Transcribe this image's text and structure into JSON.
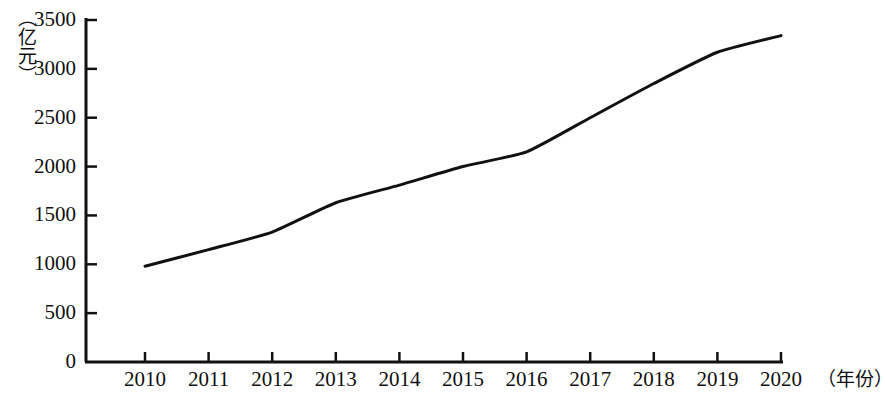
{
  "chart_data": {
    "type": "line",
    "title": "",
    "subtitle": "",
    "xlabel": "（年份）",
    "ylabel": "（亿元）",
    "x": [
      2010,
      2011,
      2012,
      2013,
      2014,
      2015,
      2016,
      2017,
      2018,
      2019,
      2020
    ],
    "categories": [
      "2010",
      "2011",
      "2012",
      "2013",
      "2014",
      "2015",
      "2016",
      "2017",
      "2018",
      "2019",
      "2020"
    ],
    "values": [
      980,
      1150,
      1330,
      1630,
      1810,
      2000,
      2150,
      2500,
      2850,
      3170,
      3340
    ],
    "series": [
      {
        "name": "",
        "values": [
          980,
          1150,
          1330,
          1630,
          1810,
          2000,
          2150,
          2500,
          2850,
          3170,
          3340
        ]
      }
    ],
    "xlim": [
      2010,
      2020
    ],
    "ylim": [
      0,
      3500
    ],
    "ytick_labels": [
      "0",
      "500",
      "1000",
      "1500",
      "2000",
      "2500",
      "3000",
      "3500"
    ],
    "ytick_values": [
      0,
      500,
      1000,
      1500,
      2000,
      2500,
      3000,
      3500
    ],
    "xtick_labels": [
      "2010",
      "2011",
      "2012",
      "2013",
      "2014",
      "2015",
      "2016",
      "2017",
      "2018",
      "2019",
      "2020"
    ],
    "grid": false,
    "legend": "none",
    "line_color": "#111111",
    "line_width": 3,
    "axis_color": "#111111",
    "markers": false
  },
  "axis": {
    "y_unit": "（亿元）",
    "x_unit": "（年份）"
  }
}
